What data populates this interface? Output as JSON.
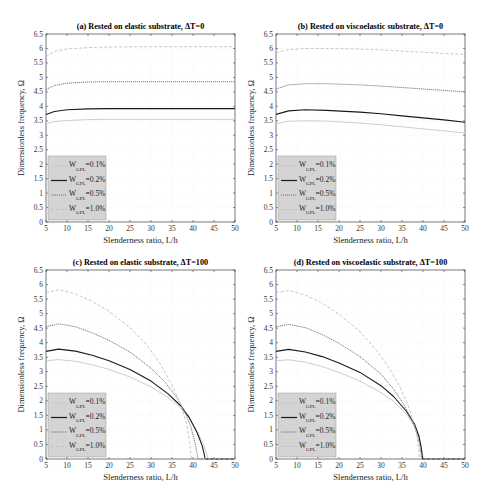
{
  "figure": {
    "panels": [
      {
        "id": "a",
        "title": "(a) Rested on elastic substrate, ΔT=0"
      },
      {
        "id": "b",
        "title": "(b) Rested on viscoelastic substrate, ΔT=0"
      },
      {
        "id": "c",
        "title": "(c) Rested on elastic substrate, ΔT=100"
      },
      {
        "id": "d",
        "title": "(d) Rested on viscoelastic substrate, ΔT=100"
      }
    ],
    "xlabel": "Slenderness ratio, L/h",
    "ylabel": "Dimensionless frequency, Ω",
    "legend": [
      {
        "label_main": "W",
        "label_sub": "GPL",
        "label_val": "=0.1%",
        "color": "#c8c8c8",
        "dash": ""
      },
      {
        "label_main": "W",
        "label_sub": "GPL",
        "label_val": "=0.2%",
        "color": "#1a1a1a",
        "dash": ""
      },
      {
        "label_main": "W",
        "label_sub": "GPL",
        "label_val": "=0.5%",
        "color": "#6e6e6e",
        "dash": "1.2,0.8"
      },
      {
        "label_main": "W",
        "label_sub": "GPL",
        "label_val": "=1.0%",
        "color": "#c0c0c0",
        "dash": "3,2"
      }
    ]
  },
  "chart_data": [
    {
      "type": "line",
      "title": "(a) Rested on elastic substrate, ΔT=0",
      "xlabel": "Slenderness ratio, L/h",
      "ylabel": "Dimensionless frequency, Ω",
      "xlim": [
        5,
        50
      ],
      "ylim": [
        0,
        6.5
      ],
      "xticks": [
        5,
        10,
        15,
        20,
        25,
        30,
        35,
        40,
        45,
        50
      ],
      "yticks": [
        0,
        0.5,
        1,
        1.5,
        2,
        2.5,
        3,
        3.5,
        4,
        4.5,
        5,
        5.5,
        6,
        6.5
      ],
      "grid": true,
      "legend_position": "lower left",
      "series": [
        {
          "name": "W_GPL=0.1%",
          "x": [
            5,
            7,
            10,
            15,
            20,
            30,
            40,
            50
          ],
          "y": [
            3.4,
            3.47,
            3.51,
            3.54,
            3.55,
            3.55,
            3.55,
            3.55
          ]
        },
        {
          "name": "W_GPL=0.2%",
          "x": [
            5,
            7,
            10,
            15,
            20,
            30,
            40,
            50
          ],
          "y": [
            3.72,
            3.82,
            3.88,
            3.91,
            3.92,
            3.92,
            3.92,
            3.92
          ]
        },
        {
          "name": "W_GPL=0.5%",
          "x": [
            5,
            7,
            10,
            15,
            20,
            30,
            40,
            50
          ],
          "y": [
            4.58,
            4.72,
            4.8,
            4.84,
            4.85,
            4.85,
            4.85,
            4.85
          ]
        },
        {
          "name": "W_GPL=1.0%",
          "x": [
            5,
            7,
            10,
            15,
            20,
            30,
            40,
            50
          ],
          "y": [
            5.72,
            5.9,
            5.98,
            6.03,
            6.05,
            6.06,
            6.06,
            6.06
          ]
        }
      ]
    },
    {
      "type": "line",
      "title": "(b) Rested on viscoelastic substrate, ΔT=0",
      "xlabel": "Slenderness ratio, L/h",
      "ylabel": "Dimensionless frequency, Ω",
      "xlim": [
        5,
        50
      ],
      "ylim": [
        0,
        6.5
      ],
      "xticks": [
        5,
        10,
        15,
        20,
        25,
        30,
        35,
        40,
        45,
        50
      ],
      "yticks": [
        0,
        0.5,
        1,
        1.5,
        2,
        2.5,
        3,
        3.5,
        4,
        4.5,
        5,
        5.5,
        6,
        6.5
      ],
      "grid": true,
      "legend_position": "lower left",
      "series": [
        {
          "name": "W_GPL=0.1%",
          "x": [
            5,
            8,
            12,
            17,
            25,
            30,
            35,
            40,
            45,
            50
          ],
          "y": [
            3.4,
            3.48,
            3.5,
            3.49,
            3.42,
            3.36,
            3.29,
            3.22,
            3.15,
            3.08
          ]
        },
        {
          "name": "W_GPL=0.2%",
          "x": [
            5,
            8,
            12,
            17,
            25,
            30,
            35,
            40,
            45,
            50
          ],
          "y": [
            3.72,
            3.84,
            3.88,
            3.86,
            3.8,
            3.74,
            3.67,
            3.6,
            3.53,
            3.45
          ]
        },
        {
          "name": "W_GPL=0.5%",
          "x": [
            5,
            8,
            12,
            17,
            25,
            30,
            35,
            40,
            45,
            50
          ],
          "y": [
            4.6,
            4.74,
            4.78,
            4.78,
            4.74,
            4.7,
            4.65,
            4.6,
            4.55,
            4.5
          ]
        },
        {
          "name": "W_GPL=1.0%",
          "x": [
            5,
            8,
            12,
            17,
            25,
            30,
            35,
            40,
            45,
            50
          ],
          "y": [
            5.85,
            5.96,
            6.0,
            6.0,
            5.98,
            5.95,
            5.91,
            5.87,
            5.83,
            5.79
          ]
        }
      ]
    },
    {
      "type": "line",
      "title": "(c) Rested on elastic substrate, ΔT=100",
      "xlabel": "Slenderness ratio, L/h",
      "ylabel": "Dimensionless frequency, Ω",
      "xlim": [
        5,
        50
      ],
      "ylim": [
        0,
        6.5
      ],
      "xticks": [
        5,
        10,
        15,
        20,
        25,
        30,
        35,
        40,
        45,
        50
      ],
      "yticks": [
        0,
        0.5,
        1,
        1.5,
        2,
        2.5,
        3,
        3.5,
        4,
        4.5,
        5,
        5.5,
        6,
        6.5
      ],
      "grid": true,
      "legend_position": "lower left",
      "series": [
        {
          "name": "W_GPL=0.1%",
          "x": [
            5,
            8,
            12,
            16,
            20,
            25,
            30,
            34,
            37,
            39,
            41,
            42.5,
            43.3,
            43.6,
            50
          ],
          "y": [
            3.38,
            3.42,
            3.36,
            3.24,
            3.08,
            2.82,
            2.48,
            2.12,
            1.76,
            1.42,
            0.95,
            0.5,
            0.15,
            0,
            0
          ]
        },
        {
          "name": "W_GPL=0.2%",
          "x": [
            5,
            8,
            12,
            16,
            20,
            25,
            30,
            34,
            37,
            39,
            41,
            42.2,
            42.7,
            42.9,
            50
          ],
          "y": [
            3.7,
            3.78,
            3.71,
            3.57,
            3.38,
            3.08,
            2.68,
            2.25,
            1.84,
            1.45,
            0.9,
            0.45,
            0.15,
            0,
            0
          ]
        },
        {
          "name": "W_GPL=0.5%",
          "x": [
            5,
            8,
            12,
            16,
            20,
            25,
            30,
            33,
            36,
            38,
            39.5,
            40.5,
            41,
            41.2,
            50
          ],
          "y": [
            4.55,
            4.65,
            4.55,
            4.34,
            4.08,
            3.68,
            3.12,
            2.7,
            2.15,
            1.65,
            1.1,
            0.55,
            0.15,
            0,
            0
          ]
        },
        {
          "name": "W_GPL=1.0%",
          "x": [
            5,
            8,
            12,
            16,
            20,
            25,
            29,
            32,
            35,
            37,
            38.5,
            39.2,
            39.5,
            39.6,
            50
          ],
          "y": [
            5.72,
            5.82,
            5.68,
            5.42,
            5.08,
            4.52,
            3.92,
            3.32,
            2.55,
            1.9,
            1.2,
            0.6,
            0.2,
            0,
            0
          ]
        }
      ]
    },
    {
      "type": "line",
      "title": "(d) Rested on viscoelastic substrate, ΔT=100",
      "xlabel": "Slenderness ratio, L/h",
      "ylabel": "Dimensionless frequency, Ω",
      "xlim": [
        5,
        50
      ],
      "ylim": [
        0,
        6.5
      ],
      "xticks": [
        5,
        10,
        15,
        20,
        25,
        30,
        35,
        40,
        45,
        50
      ],
      "yticks": [
        0,
        0.5,
        1,
        1.5,
        2,
        2.5,
        3,
        3.5,
        4,
        4.5,
        5,
        5.5,
        6,
        6.5
      ],
      "grid": true,
      "legend_position": "lower left",
      "series": [
        {
          "name": "W_GPL=0.1%",
          "x": [
            5,
            8,
            12,
            16,
            20,
            25,
            30,
            33,
            36,
            38,
            39,
            39.6,
            39.9,
            40,
            50
          ],
          "y": [
            3.38,
            3.41,
            3.33,
            3.18,
            2.98,
            2.68,
            2.28,
            1.98,
            1.55,
            1.12,
            0.75,
            0.4,
            0.12,
            0,
            0
          ]
        },
        {
          "name": "W_GPL=0.2%",
          "x": [
            5,
            8,
            12,
            16,
            20,
            25,
            30,
            33,
            36,
            38,
            39,
            39.5,
            39.8,
            39.9,
            50
          ],
          "y": [
            3.7,
            3.77,
            3.68,
            3.52,
            3.3,
            2.98,
            2.52,
            2.15,
            1.65,
            1.2,
            0.8,
            0.45,
            0.12,
            0,
            0
          ]
        },
        {
          "name": "W_GPL=0.5%",
          "x": [
            5,
            8,
            12,
            16,
            20,
            25,
            30,
            33,
            35,
            37,
            38.5,
            39.2,
            39.6,
            39.7,
            50
          ],
          "y": [
            4.55,
            4.63,
            4.52,
            4.28,
            3.98,
            3.52,
            2.92,
            2.4,
            1.98,
            1.45,
            0.9,
            0.5,
            0.15,
            0,
            0
          ]
        },
        {
          "name": "W_GPL=1.0%",
          "x": [
            5,
            8,
            12,
            16,
            20,
            25,
            29,
            32,
            34,
            36,
            37.5,
            38.5,
            39,
            39.2,
            50
          ],
          "y": [
            5.72,
            5.8,
            5.64,
            5.36,
            4.98,
            4.38,
            3.72,
            3.12,
            2.62,
            2.02,
            1.4,
            0.85,
            0.35,
            0,
            0
          ]
        }
      ]
    }
  ]
}
